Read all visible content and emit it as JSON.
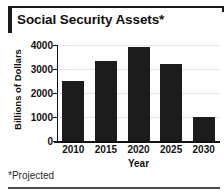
{
  "title": {
    "text": "Social Security Assets*"
  },
  "footnote": {
    "text": "*Projected"
  },
  "chart_data": {
    "type": "bar",
    "title": "Social Security Assets*",
    "categories": [
      "2010",
      "2015",
      "2020",
      "2025",
      "2030"
    ],
    "values": [
      2500,
      3330,
      3900,
      3200,
      1020
    ],
    "xlabel": "Year",
    "ylabel": "Billions of Dollars",
    "ylim": [
      0,
      4000
    ],
    "yticks": [
      "0",
      "1000",
      "2000",
      "3000",
      "4000"
    ],
    "ytick_values": [
      0,
      1000,
      2000,
      3000,
      4000
    ],
    "grid": true,
    "legend": "none",
    "bar_color": "#1c1c1c",
    "annotations": [
      "*Projected"
    ]
  }
}
